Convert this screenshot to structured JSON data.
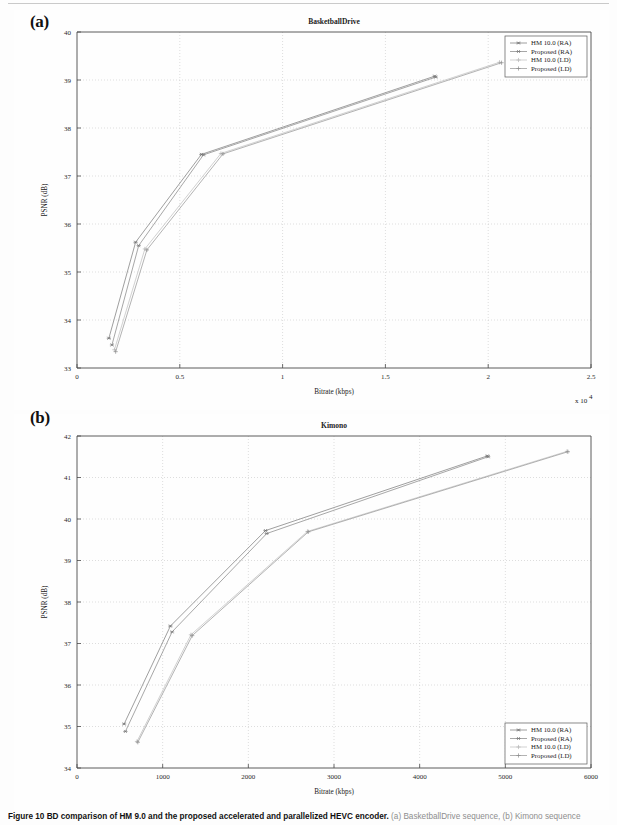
{
  "figure": {
    "caption_bold": "Figure 10 BD comparison of HM 9.0 and the proposed accelerated and parallelized HEVC encoder.",
    "caption_tail": "(a) BasketballDrive sequence, (b) Kimono sequence"
  },
  "panels": [
    {
      "id": "a",
      "panel_label": "(a)",
      "title": "BasketballDrive",
      "xlabel": "Bitrate (kbps)",
      "ylabel": "PSNR (dB)",
      "x_exponent": "x 10",
      "x_exponent_sup": "4",
      "xticks": [
        "0",
        "0.5",
        "1",
        "1.5",
        "2",
        "2.5"
      ],
      "yticks": [
        "33",
        "34",
        "35",
        "36",
        "37",
        "38",
        "39",
        "40"
      ],
      "legend_position": "top-right",
      "legend": [
        "HM 10.0 (RA)",
        "Proposed (RA)",
        "HM 10.0 (LD)",
        "Proposed (LD)"
      ]
    },
    {
      "id": "b",
      "panel_label": "(b)",
      "title": "Kimono",
      "xlabel": "Bitrate (kbps)",
      "ylabel": "PSNR (dB)",
      "x_exponent": "",
      "x_exponent_sup": "",
      "xticks": [
        "0",
        "1000",
        "2000",
        "3000",
        "4000",
        "5000",
        "6000"
      ],
      "yticks": [
        "34",
        "35",
        "36",
        "37",
        "38",
        "39",
        "40",
        "41",
        "42"
      ],
      "legend_position": "bottom-right",
      "legend": [
        "HM 10.0 (RA)",
        "Proposed (RA)",
        "HM 10.0 (LD)",
        "Proposed (LD)"
      ]
    }
  ],
  "chart_data": [
    {
      "type": "line",
      "title": "BasketballDrive",
      "xlabel": "Bitrate (kbps)",
      "ylabel": "PSNR (dB)",
      "x_scale_multiplier": 10000,
      "xlim": [
        0,
        25000
      ],
      "ylim": [
        33,
        40
      ],
      "grid": true,
      "legend_position": "upper right",
      "series": [
        {
          "name": "HM 10.0 (RA)",
          "marker": "asterisk",
          "x": [
            1550,
            2850,
            6050,
            17400
          ],
          "y": [
            33.62,
            35.62,
            37.45,
            39.08
          ]
        },
        {
          "name": "Proposed (RA)",
          "marker": "asterisk",
          "x": [
            1700,
            3000,
            6150,
            17450
          ],
          "y": [
            33.48,
            35.55,
            37.44,
            39.06
          ]
        },
        {
          "name": "HM 10.0 (LD)",
          "marker": "plus",
          "x": [
            1820,
            3300,
            7000,
            20550
          ],
          "y": [
            33.38,
            35.48,
            37.47,
            39.37
          ]
        },
        {
          "name": "Proposed (LD)",
          "marker": "plus",
          "x": [
            1880,
            3400,
            7100,
            20650
          ],
          "y": [
            33.34,
            35.46,
            37.46,
            39.36
          ]
        }
      ]
    },
    {
      "type": "line",
      "title": "Kimono",
      "xlabel": "Bitrate (kbps)",
      "ylabel": "PSNR (dB)",
      "x_scale_multiplier": 1,
      "xlim": [
        0,
        6000
      ],
      "ylim": [
        34,
        42
      ],
      "grid": true,
      "legend_position": "lower right",
      "series": [
        {
          "name": "HM 10.0 (RA)",
          "marker": "asterisk",
          "x": [
            550,
            1090,
            2200,
            4790
          ],
          "y": [
            35.06,
            37.42,
            39.72,
            41.52
          ]
        },
        {
          "name": "Proposed (RA)",
          "marker": "asterisk",
          "x": [
            565,
            1110,
            2215,
            4800
          ],
          "y": [
            34.88,
            37.28,
            39.65,
            41.5
          ]
        },
        {
          "name": "HM 10.0 (LD)",
          "marker": "plus",
          "x": [
            700,
            1330,
            2690,
            5720
          ],
          "y": [
            34.64,
            37.21,
            39.7,
            41.63
          ]
        },
        {
          "name": "Proposed (LD)",
          "marker": "plus",
          "x": [
            710,
            1345,
            2700,
            5730
          ],
          "y": [
            34.62,
            37.19,
            39.69,
            41.62
          ]
        }
      ]
    }
  ]
}
